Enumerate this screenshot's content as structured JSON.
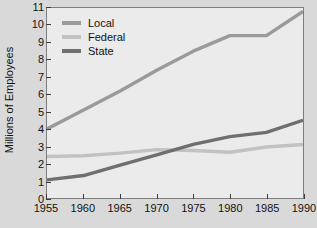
{
  "chart_data": {
    "type": "line",
    "title": "",
    "xlabel": "",
    "ylabel": "Millions of Employees",
    "xlim": [
      1955,
      1990
    ],
    "ylim": [
      0,
      11
    ],
    "grid": false,
    "legend_position": "top-left-inside",
    "xticks": [
      1955,
      1960,
      1965,
      1970,
      1975,
      1980,
      1985,
      1990
    ],
    "yticks": [
      0,
      1,
      2,
      3,
      4,
      5,
      6,
      7,
      8,
      9,
      10,
      11
    ],
    "x": [
      1955,
      1960,
      1965,
      1970,
      1975,
      1980,
      1985,
      1990
    ],
    "series": [
      {
        "name": "Local",
        "color": "#9a9a9a",
        "values": [
          4.0,
          5.1,
          6.2,
          7.4,
          8.5,
          9.4,
          9.4,
          10.8
        ]
      },
      {
        "name": "Federal",
        "color": "#c2c2c2",
        "values": [
          2.4,
          2.45,
          2.6,
          2.8,
          2.75,
          2.65,
          2.95,
          3.1
        ]
      },
      {
        "name": "State",
        "color": "#6f6f6f",
        "values": [
          1.05,
          1.3,
          1.9,
          2.5,
          3.1,
          3.55,
          3.8,
          4.5
        ]
      }
    ]
  },
  "legend": {
    "entries": [
      {
        "label": "Local"
      },
      {
        "label": "Federal"
      },
      {
        "label": "State"
      }
    ]
  },
  "axes": {
    "y_title": "Millions of Employees"
  },
  "colors": {
    "page_background": "#d9d9d9",
    "plot_background": "#ebebeb",
    "frame": "#7d7d7d",
    "text": "#111111",
    "local": "#9a9a9a",
    "federal": "#c2c2c2",
    "state": "#6f6f6f"
  }
}
